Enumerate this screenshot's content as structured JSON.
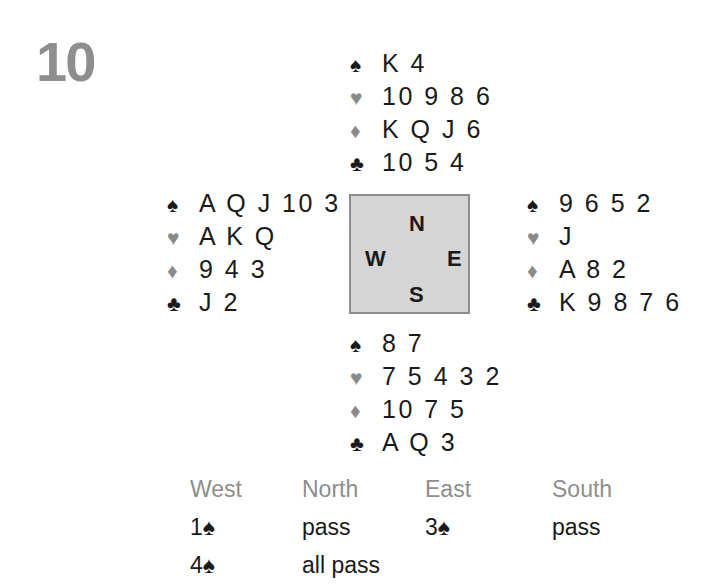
{
  "deal": {
    "number": "10"
  },
  "suits": {
    "spade": {
      "symbol": "♠",
      "tone": "black",
      "name": "spade"
    },
    "heart": {
      "symbol": "♥",
      "tone": "gray",
      "name": "heart"
    },
    "diamond": {
      "symbol": "♦",
      "tone": "gray",
      "name": "diamond"
    },
    "club": {
      "symbol": "♣",
      "tone": "black",
      "name": "club"
    }
  },
  "hands": {
    "north": {
      "label": "North",
      "spades": "K 4",
      "hearts": "10 9 8 6",
      "diamonds": "K Q J 6",
      "clubs": "10 5 4"
    },
    "west": {
      "label": "West",
      "spades": "A Q J 10 3",
      "hearts": "A K Q",
      "diamonds": "9 4 3",
      "clubs": "J 2"
    },
    "east": {
      "label": "East",
      "spades": "9 6 5 2",
      "hearts": "J",
      "diamonds": "A 8 2",
      "clubs": "K 9 8 7 6"
    },
    "south": {
      "label": "South",
      "spades": "8 7",
      "hearts": "7 5 4 3 2",
      "diamonds": "10 7 5",
      "clubs": "A Q 3"
    }
  },
  "compass": {
    "north": "N",
    "west": "W",
    "east": "E",
    "south": "S"
  },
  "auction": {
    "headers": [
      "West",
      "North",
      "East",
      "South"
    ],
    "rows": [
      [
        "1♠",
        "pass",
        "3♠",
        "pass"
      ],
      [
        "4♠",
        "all pass",
        "",
        ""
      ]
    ]
  },
  "colors": {
    "black_suit": "#1a1a1a",
    "gray_suit": "#8a8a8a",
    "deal_number": "#8e8e8e",
    "auction_header": "#8e8e8e",
    "compass_fill": "#d5d5d5",
    "compass_border": "#8d8d8d",
    "background": "#ffffff"
  }
}
